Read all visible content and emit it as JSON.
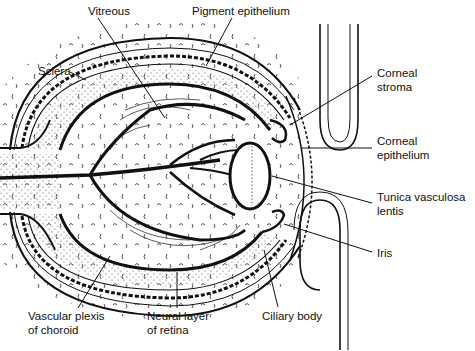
{
  "diagram": {
    "colors": {
      "ink": "#111111",
      "background": "#ffffff",
      "stipple": "#555555"
    },
    "labels": [
      {
        "id": "vitreous",
        "text": "Vitreous",
        "x": 88,
        "y": 4
      },
      {
        "id": "pigment-epithelium",
        "text": "Pigment epithelium",
        "x": 192,
        "y": 4
      },
      {
        "id": "sclera",
        "text": "Sclera",
        "x": 38,
        "y": 64
      },
      {
        "id": "corneal-stroma",
        "text": "Corneal\nstroma",
        "x": 377,
        "y": 66
      },
      {
        "id": "corneal-epithelium",
        "text": "Corneal\nepithelium",
        "x": 377,
        "y": 134
      },
      {
        "id": "tunica-vasculosa-lentis",
        "text": "Tunica vasculosa\nlentis",
        "x": 377,
        "y": 190
      },
      {
        "id": "iris",
        "text": "Iris",
        "x": 377,
        "y": 246
      },
      {
        "id": "vascular-plexis-of-choroid",
        "text": "Vascular plexis\nof choroid",
        "x": 28,
        "y": 309
      },
      {
        "id": "neural-layer-of-retina",
        "text": "Neural layer\nof retina",
        "x": 147,
        "y": 309
      },
      {
        "id": "ciliary-body",
        "text": "Ciliary body",
        "x": 262,
        "y": 309
      }
    ]
  }
}
